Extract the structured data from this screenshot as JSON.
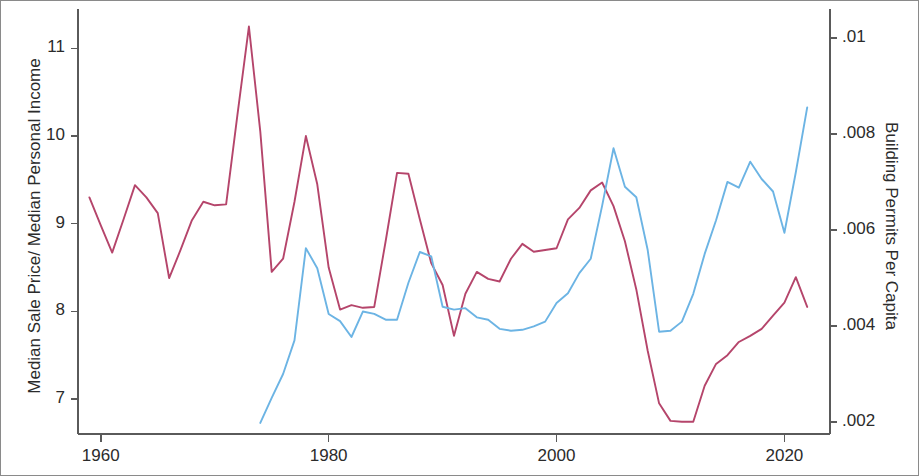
{
  "chart_data": {
    "type": "line",
    "title": "",
    "xlabel": "",
    "ylabel": "Median Sale Price/ Median Personal Income",
    "ylabel_right": "Building Permits Per Capita",
    "xlim": [
      1958,
      2024
    ],
    "ylim": [
      6.6,
      11.45
    ],
    "ylim_right": [
      0.00175,
      0.0106
    ],
    "grid": false,
    "legend": false,
    "xticks": [
      1960,
      1980,
      2000,
      2020
    ],
    "xtick_labels": [
      "1960",
      "1980",
      "2000",
      "2020"
    ],
    "yticks_left": [
      7,
      8,
      9,
      10,
      11
    ],
    "ytick_labels_left": [
      "7",
      "8",
      "9",
      "10",
      "11"
    ],
    "yticks_right": [
      0.002,
      0.004,
      0.006,
      0.008,
      0.01
    ],
    "ytick_labels_right": [
      ".002",
      ".004",
      ".006",
      ".008",
      ".01"
    ],
    "colors": {
      "price_to_income": "#b5456b",
      "building_permits": "#6cb4e4",
      "axis": "#5a5a5a",
      "text": "#2b2b2b",
      "background": "#ffffff",
      "figure_border": "#8a8a8a"
    },
    "series": [
      {
        "name": "Median Sale Price/ Median Personal Income",
        "axis": "left",
        "color": "#b5456b",
        "x": [
          1959,
          1960,
          1961,
          1962,
          1963,
          1964,
          1965,
          1966,
          1967,
          1968,
          1969,
          1970,
          1971,
          1972,
          1973,
          1974,
          1975,
          1976,
          1977,
          1978,
          1979,
          1980,
          1981,
          1982,
          1983,
          1984,
          1985,
          1986,
          1987,
          1988,
          1989,
          1990,
          1991,
          1992,
          1993,
          1994,
          1995,
          1996,
          1997,
          1998,
          1999,
          2000,
          2001,
          2002,
          2003,
          2004,
          2005,
          2006,
          2007,
          2008,
          2009,
          2010,
          2011,
          2012,
          2013,
          2014,
          2015,
          2016,
          2017,
          2018,
          2019,
          2020,
          2021,
          2022
        ],
        "values": [
          9.3,
          8.98,
          8.67,
          9.05,
          9.44,
          9.3,
          9.12,
          8.38,
          8.7,
          9.04,
          9.25,
          9.21,
          9.22,
          10.25,
          11.25,
          10.05,
          8.45,
          8.6,
          9.25,
          10.0,
          9.45,
          8.5,
          8.02,
          8.07,
          8.04,
          8.05,
          8.8,
          9.58,
          9.57,
          9.05,
          8.55,
          8.3,
          7.72,
          8.2,
          8.45,
          8.37,
          8.34,
          8.6,
          8.77,
          8.68,
          8.7,
          8.72,
          9.05,
          9.18,
          9.38,
          9.47,
          9.2,
          8.8,
          8.25,
          7.55,
          6.95,
          6.75,
          6.74,
          6.74,
          7.15,
          7.4,
          7.5,
          7.65,
          7.72,
          7.8,
          7.95,
          8.1,
          8.39,
          8.05
        ]
      },
      {
        "name": "Building Permits Per Capita",
        "axis": "right",
        "color": "#6cb4e4",
        "x": [
          1974,
          1975,
          1976,
          1977,
          1978,
          1979,
          1980,
          1981,
          1982,
          1983,
          1984,
          1985,
          1986,
          1987,
          1988,
          1989,
          1990,
          1991,
          1992,
          1993,
          1994,
          1995,
          1996,
          1997,
          1998,
          1999,
          2000,
          2001,
          2002,
          2003,
          2004,
          2005,
          2006,
          2007,
          2008,
          2009,
          2010,
          2011,
          2012,
          2013,
          2014,
          2015,
          2016,
          2017,
          2018,
          2019,
          2020,
          2021,
          2022
        ],
        "values": [
          0.00198,
          0.0025,
          0.003,
          0.0037,
          0.00562,
          0.0052,
          0.00425,
          0.0041,
          0.00377,
          0.0043,
          0.00425,
          0.00413,
          0.00413,
          0.0049,
          0.00554,
          0.00545,
          0.0044,
          0.00434,
          0.00437,
          0.00418,
          0.00413,
          0.00394,
          0.0039,
          0.00392,
          0.00399,
          0.00409,
          0.00448,
          0.00468,
          0.0051,
          0.0054,
          0.0065,
          0.0077,
          0.0069,
          0.00668,
          0.00558,
          0.00388,
          0.0039,
          0.00409,
          0.00467,
          0.0055,
          0.0062,
          0.007,
          0.00688,
          0.00742,
          0.00706,
          0.0068,
          0.00594,
          0.0072,
          0.00855
        ]
      }
    ]
  },
  "axes": {
    "left_title": "Median Sale Price/ Median Personal Income",
    "right_title": "Building Permits Per Capita"
  }
}
